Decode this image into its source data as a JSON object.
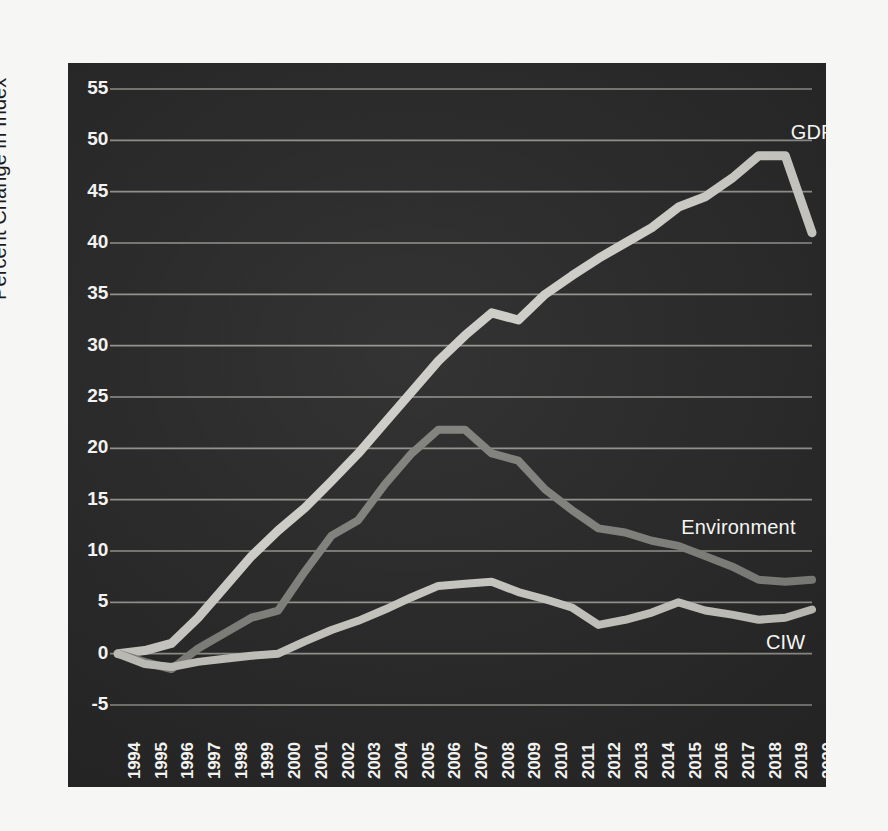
{
  "chart_data": {
    "type": "line",
    "title": "",
    "subtitle": "",
    "xlabel": "",
    "ylabel": "Percent Change in Index",
    "xlim": [
      1994,
      2020
    ],
    "ylim": [
      -5,
      55
    ],
    "ytick_step": 5,
    "grid": "horizontal",
    "legend_position": "inline-right-of-series",
    "background_color": "#262626",
    "gridline_color": "#b9b9b4",
    "x": [
      1994,
      1995,
      1996,
      1997,
      1998,
      1999,
      2000,
      2001,
      2002,
      2003,
      2004,
      2005,
      2006,
      2007,
      2008,
      2009,
      2010,
      2011,
      2012,
      2013,
      2014,
      2015,
      2016,
      2017,
      2018,
      2019,
      2020
    ],
    "categories": [
      "1994",
      "1995",
      "1996",
      "1997",
      "1998",
      "1999",
      "2000",
      "2001",
      "2002",
      "2003",
      "2004",
      "2005",
      "2006",
      "2007",
      "2008",
      "2009",
      "2010",
      "2011",
      "2012",
      "2013",
      "2014",
      "2015",
      "2016",
      "2017",
      "2018",
      "2019",
      "2020"
    ],
    "ytick_labels": [
      "55",
      "50",
      "45",
      "40",
      "35",
      "30",
      "25",
      "20",
      "15",
      "10",
      "5",
      "0",
      "-5"
    ],
    "ytick_values": [
      55,
      50,
      45,
      40,
      35,
      30,
      25,
      20,
      15,
      10,
      5,
      0,
      -5
    ],
    "series": [
      {
        "name": "GDP",
        "color": "#cccbc6",
        "width": 9,
        "label_x": 2019.2,
        "label_y": 50.6,
        "values": [
          0,
          0.3,
          1.0,
          3.5,
          6.5,
          9.5,
          12.0,
          14.2,
          16.8,
          19.5,
          22.5,
          25.5,
          28.5,
          31.0,
          33.2,
          32.5,
          35.0,
          36.8,
          38.5,
          40.0,
          41.5,
          43.5,
          44.5,
          46.3,
          48.5,
          48.5,
          41.0
        ]
      },
      {
        "name": "Environment",
        "color": "#7e7e7a",
        "width": 8,
        "label_x": 2015.4,
        "label_y": 12.1,
        "values": [
          0,
          -0.8,
          -1.5,
          0.5,
          2.0,
          3.5,
          4.2,
          8.0,
          11.5,
          13.0,
          16.5,
          19.5,
          21.8,
          21.8,
          19.5,
          18.8,
          16.0,
          14.0,
          12.2,
          11.8,
          11.0,
          10.5,
          9.5,
          8.5,
          7.2,
          7.0,
          7.2
        ]
      },
      {
        "name": "CIW",
        "color": "#c4c3bd",
        "width": 8,
        "label_x": 2018.5,
        "label_y": 0.9,
        "values": [
          0,
          -1.0,
          -1.3,
          -0.8,
          -0.5,
          -0.2,
          0.0,
          1.2,
          2.3,
          3.2,
          4.3,
          5.5,
          6.6,
          6.8,
          7.0,
          6.0,
          5.3,
          4.5,
          2.8,
          3.3,
          4.0,
          5.0,
          4.2,
          3.8,
          3.3,
          3.5,
          4.3
        ]
      }
    ]
  }
}
